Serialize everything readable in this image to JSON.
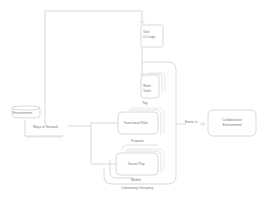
{
  "diagram": {
    "nodes": {
      "environment": {
        "label": "Environment"
      },
      "ways_of_network": {
        "label": "Ways in Network"
      },
      "tool_or_logic": {
        "label_line1": "Tool",
        "label_line2": "Or Logic"
      },
      "work_tools": {
        "label_line1": "Work",
        "label_line2": "Tools"
      },
      "functional_role": {
        "label": "Functional Role"
      },
      "social_play": {
        "label": "Social Play"
      },
      "collaborative_environment": {
        "label_line1": "Collaborative",
        "label_line2": "Environment"
      }
    },
    "group_labels": {
      "tag": "Tag",
      "purpose": "Purpose",
      "mobile": "Mobile",
      "community_grouping": "Community Grouping"
    },
    "edge_labels": {
      "exists_in": "Exists in"
    },
    "colors": {
      "stroke": "#c8c8c8",
      "text": "#777777",
      "background": "#ffffff"
    }
  }
}
